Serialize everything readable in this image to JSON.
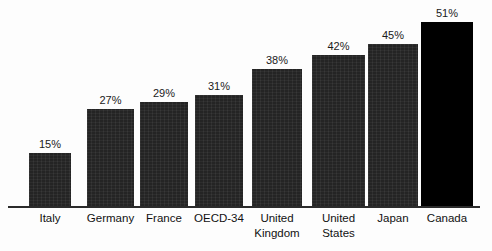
{
  "chart_data": {
    "type": "bar",
    "title": "",
    "subtitle": "",
    "xlabel": "",
    "ylabel": "",
    "ylim": [
      0,
      55
    ],
    "grid": false,
    "legend": false,
    "value_suffix": "%",
    "categories": [
      "Italy",
      "Germany",
      "France",
      "OECD-34",
      "United\nKingdom",
      "United\nStates",
      "Japan",
      "Canada"
    ],
    "values": [
      15,
      27,
      29,
      31,
      38,
      42,
      45,
      51
    ],
    "value_labels": [
      "15%",
      "27%",
      "29%",
      "31%",
      "38%",
      "42%",
      "45%",
      "51%"
    ],
    "highlight_index": 7,
    "colors": {
      "bar": "#242424",
      "bar_highlight": "#000000",
      "axis": "#2b2b2b",
      "label_text": "#111111",
      "value_text": "#1a1a1a",
      "background": "#fdfdfd"
    },
    "bars": [
      {
        "category": "Italy",
        "value": 15,
        "label": "15%",
        "x": 29,
        "width": 42,
        "highlight": false
      },
      {
        "category": "Germany",
        "value": 27,
        "label": "27%",
        "x": 87,
        "width": 47,
        "highlight": false
      },
      {
        "category": "France",
        "value": 29,
        "label": "29%",
        "x": 140,
        "width": 48,
        "highlight": false
      },
      {
        "category": "OECD-34",
        "value": 31,
        "label": "31%",
        "x": 195,
        "width": 48,
        "highlight": false
      },
      {
        "category": "United Kingdom",
        "value": 38,
        "label": "38%",
        "x": 252,
        "width": 50,
        "highlight": false
      },
      {
        "category": "United States",
        "value": 42,
        "label": "42%",
        "x": 312,
        "width": 53,
        "highlight": false
      },
      {
        "category": "Japan",
        "value": 45,
        "label": "45%",
        "x": 368,
        "width": 50,
        "highlight": false
      },
      {
        "category": "Canada",
        "value": 51,
        "label": "51%",
        "x": 421,
        "width": 52,
        "highlight": true
      }
    ]
  }
}
